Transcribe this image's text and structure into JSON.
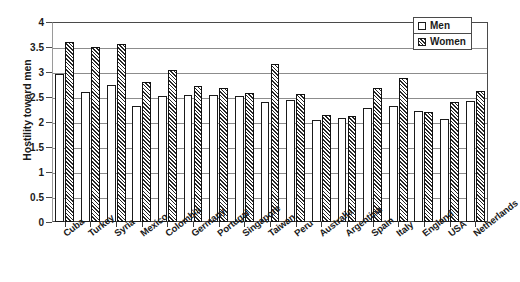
{
  "chart_data": {
    "type": "bar",
    "title": "",
    "xlabel": "",
    "ylabel": "Hostility toward men",
    "ylim": [
      0,
      4
    ],
    "ytick_step": 0.5,
    "yticks": [
      "0",
      "0.5",
      "1",
      "1.5",
      "2",
      "2.5",
      "3",
      "3.5",
      "4"
    ],
    "grid": true,
    "legend_position": "top-right",
    "categories": [
      "Cuba",
      "Turkey",
      "Syria",
      "Mexico",
      "Colombia",
      "Germany",
      "Portugal",
      "Singapore",
      "Taiwan",
      "Peru",
      "Australia",
      "Argentina",
      "Spain",
      "Italy",
      "England",
      "USA",
      "Netherlands"
    ],
    "series": [
      {
        "name": "Men",
        "values": [
          2.97,
          2.61,
          2.75,
          2.32,
          2.53,
          2.55,
          2.54,
          2.52,
          2.41,
          2.45,
          2.05,
          2.09,
          2.28,
          2.32,
          2.22,
          2.07,
          2.43
        ]
      },
      {
        "name": "Women",
        "values": [
          3.6,
          3.51,
          3.57,
          2.81,
          3.04,
          2.72,
          2.69,
          2.58,
          3.16,
          2.56,
          2.14,
          2.12,
          2.69,
          2.88,
          2.21,
          2.41,
          2.62
        ]
      }
    ]
  },
  "legend": {
    "items": [
      {
        "label": "Men",
        "swatch": "open-square-swatch"
      },
      {
        "label": "Women",
        "swatch": "hatched-square-swatch"
      }
    ]
  },
  "axes": {
    "y_title": "Hostility toward men"
  }
}
